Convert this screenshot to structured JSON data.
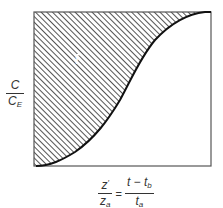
{
  "diagram": {
    "type": "breakthrough-curve",
    "ylabel": {
      "numerator": "C",
      "denominator": "C",
      "denominator_sub": "E"
    },
    "xlabel": {
      "left": {
        "numerator": "z",
        "numerator_sup": "′",
        "denominator": "z",
        "denominator_sub": "a"
      },
      "equals": "=",
      "right": {
        "numerator": "t − t",
        "numerator_sub": "b",
        "denominator": "t",
        "denominator_sub": "a"
      }
    },
    "region_label": "t̄",
    "colors": {
      "frame": "#555555",
      "curve": "#111111",
      "hatch": "#555555",
      "background": "#ffffff"
    }
  }
}
